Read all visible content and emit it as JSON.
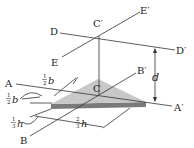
{
  "diagram": {
    "type": "triangular plate with parallel axes",
    "colors": {
      "plate_top": "#c8c8c8",
      "plate_edge": "#7a7a7a",
      "lines": "#333333"
    },
    "axes": {
      "A": "A",
      "A_prime": "A′",
      "B": "B",
      "B_prime": "B′",
      "C": "C",
      "C_prime": "C′",
      "D": "D",
      "D_prime": "D′",
      "E": "E",
      "E_prime": "E′"
    },
    "dimensions": {
      "d": "d",
      "half_b_top": {
        "num": "1",
        "den": "2",
        "var": "b"
      },
      "half_b_left": {
        "num": "1",
        "den": "2",
        "var": "b"
      },
      "third_h": {
        "num": "1",
        "den": "3",
        "var": "h"
      },
      "two_thirds_h": {
        "num": "2",
        "den": "3",
        "var": "h"
      }
    }
  }
}
